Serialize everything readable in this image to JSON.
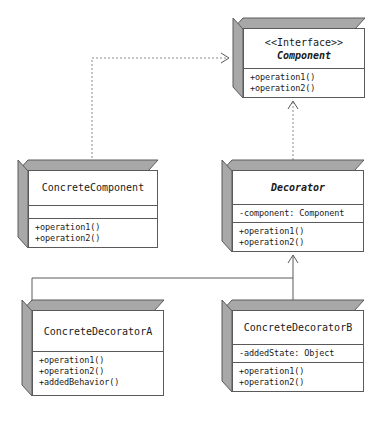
{
  "diagram": {
    "style": {
      "line_color": "#5a5a5a",
      "fill_color": "#ffffff",
      "extrusion_color": "#a8a8a8",
      "background": "#ffffff"
    },
    "classes": [
      {
        "id": "component",
        "stereotype": "<<Interface>>",
        "name": "Component",
        "abstract": true,
        "attributes": [],
        "operations": [
          "+operation1()",
          "+operation2()"
        ]
      },
      {
        "id": "concrete_component",
        "stereotype": "",
        "name": "ConcreteComponent",
        "abstract": false,
        "attributes": [],
        "operations": [
          "+operation1()",
          "+operation2()"
        ]
      },
      {
        "id": "decorator",
        "stereotype": "",
        "name": "Decorator",
        "abstract": true,
        "attributes": [
          "-component: Component"
        ],
        "operations": [
          "+operation1()",
          "+operation2()"
        ]
      },
      {
        "id": "concrete_decorator_a",
        "stereotype": "",
        "name": "ConcreteDecoratorA",
        "abstract": false,
        "attributes": [],
        "operations": [
          "+operation1()",
          "+operation2()",
          "+addedBehavior()"
        ]
      },
      {
        "id": "concrete_decorator_b",
        "stereotype": "",
        "name": "ConcreteDecoratorB",
        "abstract": false,
        "attributes": [
          "-addedState: Object"
        ],
        "operations": [
          "+operation1()",
          "+operation2()"
        ]
      }
    ],
    "relationships": [
      {
        "id": "rel_concrete_component_realizes",
        "type": "realization",
        "line": "dashed",
        "arrow": "open",
        "from": "ConcreteComponent",
        "to": "Component"
      },
      {
        "id": "rel_decorator_realizes",
        "type": "realization",
        "line": "dashed",
        "arrow": "open",
        "from": "Decorator",
        "to": "Component"
      },
      {
        "id": "rel_decorator_a_generalization",
        "type": "generalization",
        "line": "solid",
        "arrow": "open",
        "from": "ConcreteDecoratorA",
        "to": "Decorator"
      },
      {
        "id": "rel_decorator_b_generalization",
        "type": "generalization",
        "line": "solid",
        "arrow": "open",
        "from": "ConcreteDecoratorB",
        "to": "Decorator"
      }
    ]
  }
}
